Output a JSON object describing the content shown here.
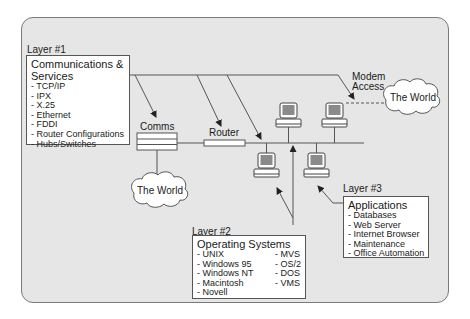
{
  "layer1": {
    "heading": "Layer #1",
    "title": "Communications & Services",
    "title_line1": "Communications &",
    "title_line2": "Services",
    "items": [
      "TCP/IP",
      "IPX",
      "X.25",
      "Ethernet",
      "FDDI",
      "Router Configurations",
      "Hubs/Switches"
    ]
  },
  "layer2": {
    "heading": "Layer #2",
    "title": "Operating Systems",
    "col1": [
      "UNIX",
      "Windows 95",
      "Windows NT",
      "Macintosh",
      "Novell"
    ],
    "col2": [
      "MVS",
      "OS/2",
      "DOS",
      "VMS"
    ]
  },
  "layer3": {
    "heading": "Layer #3",
    "title": "Applications",
    "items": [
      "Databases",
      "Web Server",
      "Internet Browser",
      "Maintenance",
      "Office Automation"
    ]
  },
  "network": {
    "comms_label": "Comms",
    "router_label": "Router",
    "modem_label_line1": "Modem",
    "modem_label_line2": "Access",
    "cloud_left": "The World",
    "cloud_right": "The World",
    "computer_count": 4
  },
  "colors": {
    "panel_bg": "#e6e6e6",
    "panel_border": "#7a7a7a",
    "line": "#555555",
    "screen": "#8a8a8a",
    "box_bg": "#ffffff"
  }
}
